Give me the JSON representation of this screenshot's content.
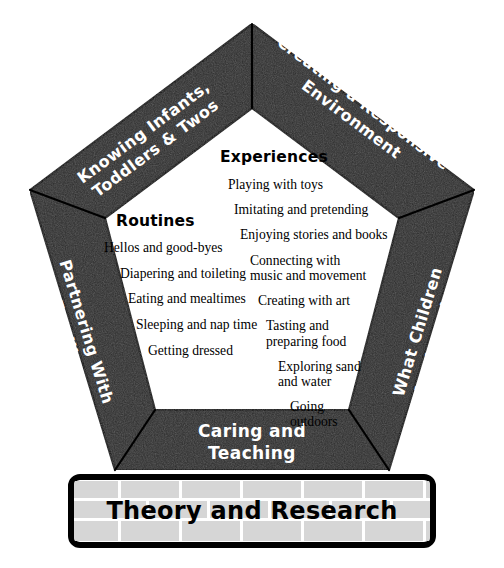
{
  "diagram": {
    "colors": {
      "band_fill": "#2b2b2b",
      "band_stroke": "#000000",
      "band_text": "#ffffff",
      "brick_fill": "#d6d6d6",
      "mortar": "#ffffff",
      "background": "#ffffff",
      "body_text": "#000000"
    }
  },
  "bands": {
    "top_left": {
      "line1": "Knowing Infants,",
      "line2": "Toddlers & Twos"
    },
    "top_right": {
      "line1": "Creating a Responsive",
      "line2": "Environment"
    },
    "left": {
      "line1": "Partnering With",
      "line2": "Families"
    },
    "right": {
      "line1": "What Children",
      "line2": "Are Learning"
    },
    "bottom": {
      "line1": "Caring and",
      "line2": "Teaching"
    }
  },
  "columns": {
    "routines": {
      "heading": "Routines",
      "items": [
        "Hellos and good-byes",
        "Diapering and toileting",
        "Eating and mealtimes",
        "Sleeping and nap time",
        "Getting dressed"
      ]
    },
    "experiences": {
      "heading": "Experiences",
      "items": [
        "Playing with toys",
        "Imitating and pretending",
        "Enjoying stories and books",
        "Connecting with\nmusic and movement",
        "Creating with art",
        "Tasting and\npreparing food",
        "Exploring sand\nand water",
        "Going\noutdoors"
      ]
    }
  },
  "foundation": {
    "label": "Theory and Research"
  }
}
